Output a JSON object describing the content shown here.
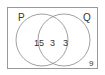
{
  "diagram": {
    "type": "venn",
    "universe_label": "",
    "sets": [
      {
        "label": "P"
      },
      {
        "label": "Q"
      }
    ],
    "regions": {
      "p_only": "15",
      "p_and_q": "3",
      "q_only": "3",
      "outside": "9"
    },
    "colors": {
      "stroke": "#888888",
      "text": "#333333",
      "background": "#ffffff"
    }
  }
}
